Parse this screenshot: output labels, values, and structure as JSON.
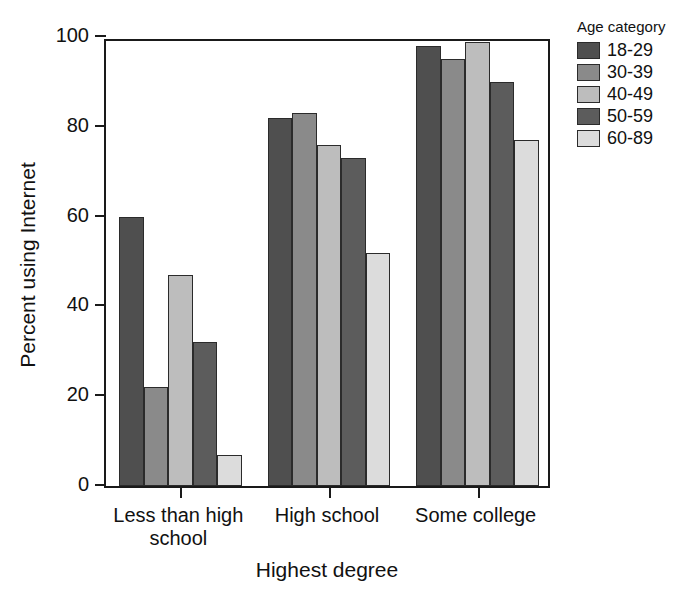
{
  "chart_data": {
    "type": "bar",
    "title": "",
    "xlabel": "Highest degree",
    "ylabel": "Percent using Internet",
    "categories": [
      "Less than high school",
      "High school",
      "Some college"
    ],
    "category_lines": [
      [
        "Less than high",
        "school"
      ],
      [
        "High school"
      ],
      [
        "Some college"
      ]
    ],
    "series": [
      {
        "name": "18-29",
        "color": "#4f4f4f",
        "values": [
          60,
          82,
          98
        ]
      },
      {
        "name": "30-39",
        "color": "#8a8a8a",
        "values": [
          22,
          83,
          95
        ]
      },
      {
        "name": "40-49",
        "color": "#bdbdbd",
        "values": [
          47,
          76,
          99
        ]
      },
      {
        "name": "50-59",
        "color": "#5c5c5c",
        "values": [
          32,
          73,
          90
        ]
      },
      {
        "name": "60-89",
        "color": "#dcdcdc",
        "values": [
          7,
          52,
          77
        ]
      }
    ],
    "ylim": [
      0,
      100
    ],
    "yticks": [
      0,
      20,
      40,
      60,
      80,
      100
    ],
    "ytick_labels": [
      "0",
      "20",
      "40",
      "60",
      "80",
      "100"
    ],
    "grid": false,
    "legend": {
      "title": "Age category",
      "position": "right-top",
      "entries": [
        "18-29",
        "30-39",
        "40-49",
        "50-59",
        "60-89"
      ]
    }
  }
}
